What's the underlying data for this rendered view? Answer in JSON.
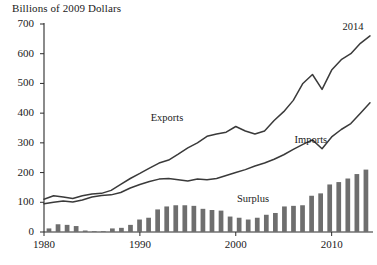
{
  "chart_data": {
    "type": "line",
    "title": "Billions of 2009 Dollars",
    "xlabel": "",
    "ylabel": "Billions of 2009 Dollars",
    "xlim": [
      1980,
      2014
    ],
    "ylim": [
      0,
      700
    ],
    "y_ticks": [
      0,
      100,
      200,
      300,
      400,
      500,
      600,
      700
    ],
    "x_ticks": [
      1980,
      1990,
      2000,
      2010
    ],
    "grid": false,
    "legend": "inline-annotations",
    "annotations": [
      {
        "text": "2014",
        "x": 2013,
        "y": 690
      },
      {
        "text": "Exports",
        "x": 1993,
        "y": 385
      },
      {
        "text": "Imports",
        "x": 2008,
        "y": 310
      },
      {
        "text": "Surplus",
        "x": 2002,
        "y": 110
      }
    ],
    "x": [
      1980,
      1981,
      1982,
      1983,
      1984,
      1985,
      1986,
      1987,
      1988,
      1989,
      1990,
      1991,
      1992,
      1993,
      1994,
      1995,
      1996,
      1997,
      1998,
      1999,
      2000,
      2001,
      2002,
      2003,
      2004,
      2005,
      2006,
      2007,
      2008,
      2009,
      2010,
      2011,
      2012,
      2013,
      2014
    ],
    "series": [
      {
        "name": "Exports",
        "color": "#3a3a3a",
        "values": [
          110,
          122,
          118,
          113,
          122,
          128,
          130,
          140,
          160,
          180,
          197,
          215,
          232,
          242,
          262,
          283,
          300,
          322,
          330,
          336,
          355,
          340,
          330,
          340,
          375,
          405,
          443,
          500,
          530,
          480,
          545,
          580,
          600,
          635,
          660
        ]
      },
      {
        "name": "Imports",
        "color": "#3a3a3a",
        "values": [
          95,
          100,
          104,
          101,
          108,
          118,
          123,
          125,
          133,
          148,
          160,
          170,
          178,
          180,
          176,
          172,
          178,
          176,
          180,
          190,
          200,
          210,
          222,
          232,
          245,
          260,
          278,
          295,
          310,
          280,
          320,
          345,
          365,
          400,
          435
        ]
      }
    ],
    "bars": {
      "name": "Surplus",
      "color": "#6e6e6e",
      "values": [
        12,
        26,
        24,
        20,
        5,
        1,
        1,
        12,
        14,
        24,
        42,
        48,
        76,
        86,
        90,
        90,
        88,
        78,
        74,
        72,
        52,
        48,
        42,
        48,
        58,
        64,
        86,
        88,
        90,
        122,
        130,
        160,
        168,
        180,
        195,
        210
      ]
    }
  }
}
